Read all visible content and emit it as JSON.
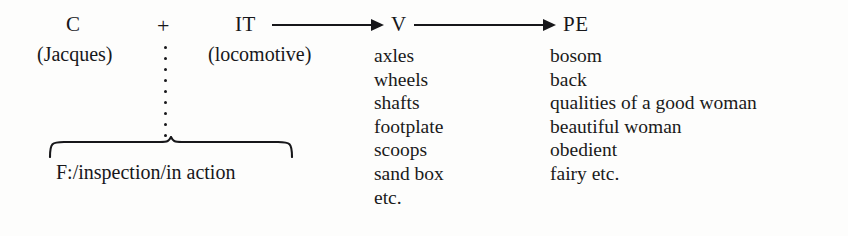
{
  "diagram": {
    "type": "semiotic-expansion-diagram",
    "background_color": "#fdfdfc",
    "ink_color": "#17171a",
    "nodes": {
      "c": {
        "label": "C",
        "gloss": "(Jacques)"
      },
      "plus": {
        "label": "+"
      },
      "it": {
        "label": "IT",
        "gloss": "(locomotive)"
      },
      "v": {
        "label": "V"
      },
      "pe": {
        "label": "PE"
      }
    },
    "connectors": {
      "it_to_v": {
        "kind": "arrow",
        "from": "IT",
        "to": "V"
      },
      "v_to_pe": {
        "kind": "arrow",
        "from": "V",
        "to": "PE"
      },
      "c_to_brace": {
        "kind": "vertical-dotted-line"
      }
    },
    "brace": {
      "kind": "horizontal-curly-brace",
      "caption": "F:/inspection/in action",
      "spans": [
        "C",
        "(Jacques)",
        "+",
        "IT",
        "(locomotive)"
      ]
    },
    "columns": [
      {
        "heading": "V",
        "items": [
          "axles",
          "wheels",
          "shafts",
          "footplate",
          "scoops",
          "sand box",
          "etc."
        ]
      },
      {
        "heading": "PE",
        "items": [
          "bosom",
          "back",
          "qualities of a good woman",
          "beautiful woman",
          "obedient",
          "fairy etc."
        ]
      }
    ]
  }
}
